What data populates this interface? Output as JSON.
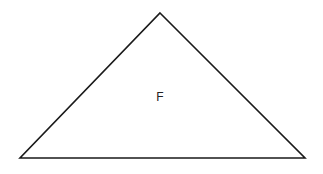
{
  "diagram": {
    "shape": "triangle",
    "stroke_color": "#1a1a1a",
    "stroke_width": 1.6,
    "fill_color": "#ffffff",
    "vertices": {
      "apex": {
        "x": 160,
        "y": 13
      },
      "bottom_left": {
        "x": 20,
        "y": 158
      },
      "bottom_right": {
        "x": 305,
        "y": 158
      }
    },
    "label": {
      "text": "F",
      "x": 160,
      "y": 101
    }
  }
}
